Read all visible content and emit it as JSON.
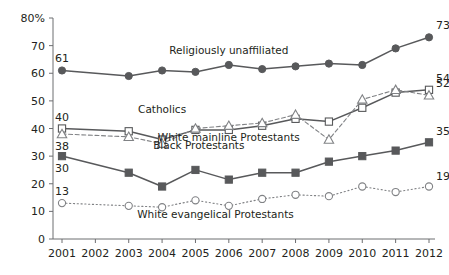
{
  "chart_data": {
    "type": "line",
    "title": "",
    "xlabel": "",
    "ylabel": "",
    "ylim": [
      0,
      80
    ],
    "yticks": [
      "0",
      "10",
      "20",
      "30",
      "40",
      "50",
      "60",
      "70",
      "80%"
    ],
    "ytick_values": [
      0,
      10,
      20,
      30,
      40,
      50,
      60,
      70,
      80
    ],
    "grid": false,
    "legend_position": "inline-labels",
    "categories": [
      "2001",
      "2002",
      "2003",
      "2004",
      "2005",
      "2006",
      "2007",
      "2008",
      "2009",
      "2010",
      "2011",
      "2012"
    ],
    "x": [
      2001,
      2002,
      2003,
      2004,
      2005,
      2006,
      2007,
      2008,
      2009,
      2010,
      2011,
      2012
    ],
    "series": [
      {
        "name": "Religiously unaffiliated",
        "marker": "filled-circle",
        "line_style": "solid",
        "color": "#58595b",
        "label_x": 2006,
        "label_y": 67,
        "start_label": "61",
        "end_label": "73",
        "values": [
          61,
          null,
          59,
          61,
          60.5,
          63,
          61.5,
          62.5,
          63.5,
          63,
          69,
          73
        ]
      },
      {
        "name": "Catholics",
        "marker": "open-square",
        "line_style": "solid",
        "color": "#58595b",
        "label_x": 2004,
        "label_y": 45.5,
        "start_label": "40",
        "end_label": "54",
        "values": [
          40,
          null,
          39,
          36,
          39.5,
          39.5,
          41,
          43.5,
          42.5,
          47.5,
          53,
          54
        ]
      },
      {
        "name": "White mainline Protestants",
        "marker": "open-triangle",
        "line_style": "dashed",
        "color": "#808285",
        "label_x": 2006,
        "label_y": 35.5,
        "start_label": "38",
        "end_label": "52",
        "values": [
          38,
          null,
          37,
          34.5,
          40,
          41,
          42,
          45,
          36,
          50.5,
          54,
          52
        ]
      },
      {
        "name": "Black Protestants",
        "marker": "filled-square",
        "line_style": "solid",
        "color": "#58595b",
        "label_x": 2005.1,
        "label_y": 32.5,
        "start_label": "30",
        "end_label": "35",
        "values": [
          30,
          null,
          24,
          19,
          25,
          21.5,
          24,
          24,
          28,
          30,
          32,
          35
        ]
      },
      {
        "name": "White evangelical Protestants",
        "marker": "open-circle",
        "line_style": "dotted",
        "color": "#808285",
        "label_x": 2005.6,
        "label_y": 7.5,
        "start_label": "13",
        "end_label": "19",
        "values": [
          13,
          null,
          12,
          11.5,
          14,
          12,
          14.5,
          16,
          15.5,
          19,
          17,
          19
        ]
      }
    ]
  }
}
